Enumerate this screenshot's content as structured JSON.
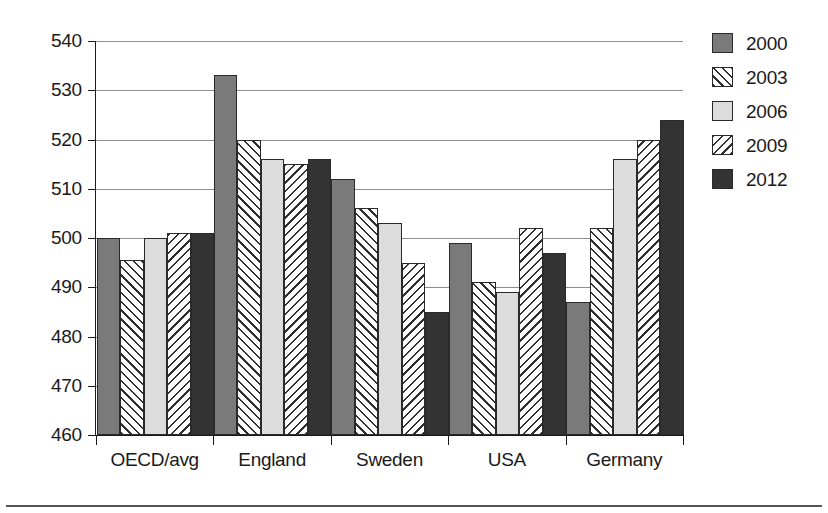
{
  "chart_data": {
    "type": "bar",
    "title": "",
    "subtitle": "",
    "xlabel": "",
    "ylabel": "",
    "ylim": [
      460,
      540
    ],
    "ytick_step": 10,
    "yticks": [
      460,
      470,
      480,
      490,
      500,
      510,
      520,
      530,
      540
    ],
    "grid": true,
    "legend_position": "right",
    "categories": [
      "OECD/avg",
      "England",
      "Sweden",
      "USA",
      "Germany"
    ],
    "series": [
      {
        "name": "2000",
        "pattern": "solid-medium-gray",
        "color": "#7a7a7a",
        "values": [
          500,
          533,
          512,
          499,
          487
        ]
      },
      {
        "name": "2003",
        "pattern": "forward-diagonal-hatch",
        "color": "#ffffff",
        "values": [
          495.5,
          520,
          506,
          491,
          502
        ]
      },
      {
        "name": "2006",
        "pattern": "solid-light-gray",
        "color": "#dcdcdc",
        "values": [
          500,
          516,
          503,
          489,
          516
        ]
      },
      {
        "name": "2009",
        "pattern": "back-diagonal-hatch",
        "color": "#ffffff",
        "values": [
          501,
          515,
          495,
          502,
          520
        ]
      },
      {
        "name": "2012",
        "pattern": "solid-dark-gray",
        "color": "#333333",
        "values": [
          501,
          516,
          485,
          497,
          524
        ]
      }
    ]
  },
  "legend": {
    "items": [
      {
        "label": "2000"
      },
      {
        "label": "2003"
      },
      {
        "label": "2006"
      },
      {
        "label": "2009"
      },
      {
        "label": "2012"
      }
    ]
  }
}
